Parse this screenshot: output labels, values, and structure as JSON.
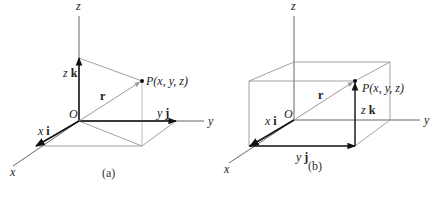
{
  "figure": {
    "panels": [
      {
        "id": "a",
        "caption": "(a)",
        "axes": {
          "x": "x",
          "y": "y",
          "z": "z"
        },
        "origin_label": "O",
        "point_label": "P(x, y, z)",
        "vectors": {
          "r": "r",
          "xi_coef": "x",
          "xi_unit": "i",
          "yj_coef": "y",
          "yj_unit": "j",
          "zk_coef": "z",
          "zk_unit": "k"
        }
      },
      {
        "id": "b",
        "caption": "(b)",
        "axes": {
          "x": "x",
          "y": "y",
          "z": "z"
        },
        "origin_label": "O",
        "point_label": "P(x, y, z)",
        "vectors": {
          "r": "r",
          "xi_coef": "x",
          "xi_unit": "i",
          "yj_coef": "y",
          "yj_unit": "j",
          "zk_coef": "z",
          "zk_unit": "k"
        }
      }
    ],
    "colors": {
      "axis": "#555555",
      "vector": "#111111",
      "position_vector": "#9a9a9a",
      "guide": "#8a8a8a"
    }
  }
}
